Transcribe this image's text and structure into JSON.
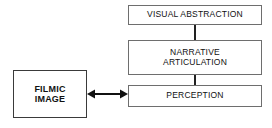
{
  "diagram": {
    "background_color": "#ffffff",
    "border_color": "#6e6e6e",
    "line_color": "#222222",
    "nodes": {
      "visual_abstraction": {
        "label": "VISUAL ABSTRACTION",
        "style": "regular"
      },
      "narrative_articulation": {
        "label": "NARRATIVE\nARTICULATION",
        "style": "regular"
      },
      "perception": {
        "label": "PERCEPTION",
        "style": "regular"
      },
      "filmic_image": {
        "label": "FILMIC\nIMAGE",
        "style": "bold"
      }
    },
    "connectors": [
      {
        "id": "visual-abstraction-to-narrative-articulation",
        "from": "visual_abstraction",
        "to": "narrative_articulation",
        "kind": "line",
        "orientation": "vertical",
        "arrowheads": "none"
      },
      {
        "id": "narrative-articulation-to-perception",
        "from": "narrative_articulation",
        "to": "perception",
        "kind": "line",
        "orientation": "vertical",
        "arrowheads": "none"
      },
      {
        "id": "filmic-image-to-perception",
        "from": "filmic_image",
        "to": "perception",
        "kind": "arrow",
        "orientation": "horizontal",
        "arrowheads": "both"
      }
    ]
  }
}
